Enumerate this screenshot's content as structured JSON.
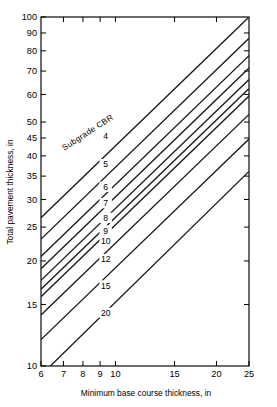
{
  "chart_data": {
    "type": "line",
    "title": "",
    "subtitle": "",
    "xlabel": "Minimum base course thickness, in",
    "ylabel": "Total pavement thickness, in",
    "xscale": "log",
    "yscale": "log",
    "xlim": [
      6,
      25
    ],
    "ylim": [
      10,
      100
    ],
    "grid": false,
    "legend_position": "inline-curve-labels",
    "legend_title": "Subgrade CBR",
    "xticks": [
      6,
      7,
      8,
      9,
      10,
      15,
      20,
      25
    ],
    "xtick_labels": [
      "6",
      "7",
      "8",
      "9",
      "10",
      "15",
      "20",
      "25"
    ],
    "yticks": [
      10,
      15,
      20,
      25,
      30,
      35,
      40,
      45,
      50,
      60,
      70,
      80,
      90,
      100
    ],
    "ytick_labels": [
      "10",
      "15",
      "20",
      "25",
      "30",
      "35",
      "40",
      "45",
      "50",
      "60",
      "70",
      "80",
      "90",
      "100"
    ],
    "annotations": [
      {
        "text": "Subgrade CBR",
        "x": 8.35,
        "y": 46.0,
        "rotation": -33
      }
    ],
    "series": [
      {
        "name": "4",
        "label": "4",
        "label_x": 9.35,
        "label_y": 45.5,
        "x": [
          6.0,
          25.0
        ],
        "y": [
          26.6,
          100.0
        ]
      },
      {
        "name": "5",
        "label": "5",
        "label_x": 9.35,
        "label_y": 37.6,
        "x": [
          6.0,
          25.0
        ],
        "y": [
          23.1,
          86.9
        ]
      },
      {
        "name": "6",
        "label": "6",
        "label_x": 9.35,
        "label_y": 32.4,
        "x": [
          6.0,
          25.0
        ],
        "y": [
          20.6,
          77.5
        ]
      },
      {
        "name": "7",
        "label": "7",
        "label_x": 9.35,
        "label_y": 29.1,
        "x": [
          6.0,
          25.0
        ],
        "y": [
          19.0,
          71.4
        ]
      },
      {
        "name": "8",
        "label": "8",
        "label_x": 9.35,
        "label_y": 26.4,
        "x": [
          6.0,
          25.0
        ],
        "y": [
          17.6,
          66.2
        ]
      },
      {
        "name": "9",
        "label": "9",
        "label_x": 9.35,
        "label_y": 24.3,
        "x": [
          6.0,
          25.0
        ],
        "y": [
          16.6,
          62.4
        ]
      },
      {
        "name": "10",
        "label": "10",
        "label_x": 9.35,
        "label_y": 22.7,
        "x": [
          6.0,
          25.0
        ],
        "y": [
          15.8,
          59.4
        ]
      },
      {
        "name": "12",
        "label": "12",
        "label_x": 9.35,
        "label_y": 20.1,
        "x": [
          6.0,
          25.0
        ],
        "y": [
          14.0,
          52.6
        ]
      },
      {
        "name": "15",
        "label": "15",
        "label_x": 9.35,
        "label_y": 16.9,
        "x": [
          6.0,
          25.0
        ],
        "y": [
          11.9,
          44.7
        ]
      },
      {
        "name": "20",
        "label": "20",
        "label_x": 9.35,
        "label_y": 14.1,
        "x": [
          6.4,
          25.0
        ],
        "y": [
          10.0,
          36.1
        ]
      }
    ]
  }
}
